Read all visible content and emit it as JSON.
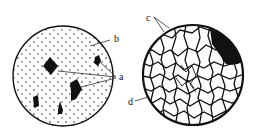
{
  "figure": {
    "left_panel": {
      "description": "circle with dotted matrix and dark polygonal particles",
      "labels": {
        "matrix": "b",
        "particles": "a"
      }
    },
    "right_panel": {
      "description": "circle with dense network of grain boundaries and dark region",
      "labels": {
        "top": "c",
        "left": "d"
      }
    }
  },
  "colors": {
    "ink": "#111111",
    "background": "#ffffff"
  }
}
